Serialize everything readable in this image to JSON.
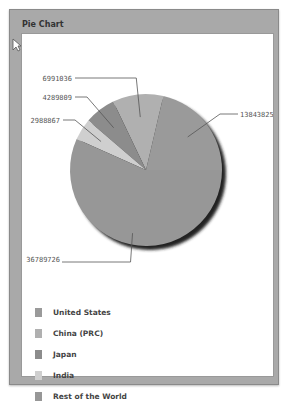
{
  "panel": {
    "title": "Pie Chart"
  },
  "chart_data": {
    "type": "pie",
    "title": "Pie Chart",
    "categories": [
      "United States",
      "China (PRC)",
      "Japan",
      "India",
      "Rest of the World"
    ],
    "values": [
      13843825,
      6991036,
      4289809,
      2988867,
      36789726
    ],
    "colors": [
      "#9a9a9a",
      "#b0b0b0",
      "#8c8c8c",
      "#cfcfcf",
      "#979797"
    ],
    "labels": [
      "13843825",
      "6991036",
      "4289809",
      "2988867",
      "36789726"
    ],
    "legend_position": "bottom-left",
    "start_angle": "3 o'clock, counterclockwise"
  },
  "legend": [
    {
      "label": "United States",
      "color": "#9a9a9a"
    },
    {
      "label": "China (PRC)",
      "color": "#b0b0b0"
    },
    {
      "label": "Japan",
      "color": "#8c8c8c"
    },
    {
      "label": "India",
      "color": "#cfcfcf"
    },
    {
      "label": "Rest of the World",
      "color": "#979797"
    }
  ]
}
